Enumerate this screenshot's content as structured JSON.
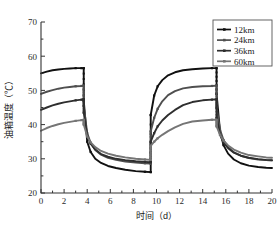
{
  "chart_data": {
    "type": "line",
    "title": "",
    "xlabel": "时间（d）",
    "ylabel": "油箱温度（℃）",
    "xlim": [
      0,
      20
    ],
    "ylim": [
      20,
      70
    ],
    "xticks": [
      0,
      2,
      4,
      6,
      8,
      10,
      12,
      14,
      16,
      18,
      20
    ],
    "yticks": [
      20,
      30,
      40,
      50,
      60,
      70
    ],
    "xtick_labels": [
      "0",
      "2",
      "4",
      "6",
      "8",
      "10",
      "12",
      "14",
      "16",
      "18",
      "20"
    ],
    "ytick_labels": [
      "20",
      "30",
      "40",
      "50",
      "60",
      "70"
    ],
    "grid": false,
    "legend_position": "top-right",
    "minor_ticks": true,
    "markers": "filled-square",
    "segment_breaks": [
      3.7,
      9.5,
      15.2
    ],
    "series": [
      {
        "name": "12km",
        "color": "#111111",
        "x": [
          0,
          0.5,
          1,
          1.5,
          2,
          2.5,
          3,
          3.5,
          3.7,
          3.7,
          4,
          4.3,
          4.7,
          5.2,
          5.8,
          6.5,
          7.3,
          8.2,
          9,
          9.5,
          9.5,
          9.8,
          10.1,
          10.5,
          11,
          11.6,
          12.3,
          13.1,
          14,
          14.8,
          15.2,
          15.2,
          15.5,
          15.8,
          16.2,
          16.7,
          17.3,
          18,
          18.8,
          19.5,
          20
        ],
        "y": [
          55.0,
          55.5,
          55.9,
          56.1,
          56.3,
          56.4,
          56.5,
          56.5,
          56.5,
          47.0,
          35.0,
          32.0,
          30.0,
          28.8,
          27.9,
          27.3,
          26.8,
          26.4,
          26.2,
          26.1,
          42.8,
          48.5,
          51.2,
          53.0,
          54.4,
          55.3,
          55.9,
          56.2,
          56.4,
          56.5,
          56.5,
          49.0,
          38.0,
          34.0,
          31.5,
          29.8,
          28.7,
          28.0,
          27.6,
          27.4,
          27.3
        ]
      },
      {
        "name": "24km",
        "color": "#4f4f4f",
        "x": [
          0,
          0.5,
          1,
          1.5,
          2,
          2.5,
          3,
          3.5,
          3.7,
          3.7,
          4,
          4.3,
          4.7,
          5.2,
          5.8,
          6.5,
          7.3,
          8.2,
          9,
          9.5,
          9.5,
          9.8,
          10.1,
          10.5,
          11,
          11.6,
          12.3,
          13.1,
          14,
          14.8,
          15.2,
          15.2,
          15.5,
          15.8,
          16.2,
          16.7,
          17.3,
          18,
          18.8,
          19.5,
          20
        ],
        "y": [
          49.0,
          49.6,
          50.1,
          50.5,
          50.8,
          51.0,
          51.2,
          51.3,
          51.4,
          45.5,
          37.5,
          34.6,
          32.6,
          31.2,
          30.3,
          29.7,
          29.2,
          28.9,
          28.7,
          28.6,
          38.0,
          42.0,
          44.6,
          46.8,
          48.6,
          49.8,
          50.6,
          51.0,
          51.2,
          51.3,
          51.4,
          45.0,
          38.5,
          35.5,
          33.4,
          31.9,
          30.9,
          30.2,
          29.8,
          29.6,
          29.5
        ]
      },
      {
        "name": "36km",
        "color": "#2e2e2e",
        "x": [
          0,
          0.5,
          1,
          1.5,
          2,
          2.5,
          3,
          3.5,
          3.7,
          3.7,
          4,
          4.3,
          4.7,
          5.2,
          5.8,
          6.5,
          7.3,
          8.2,
          9,
          9.5,
          9.5,
          9.8,
          10.1,
          10.5,
          11,
          11.6,
          12.3,
          13.1,
          14,
          14.8,
          15.2,
          15.2,
          15.5,
          15.8,
          16.2,
          16.7,
          17.3,
          18,
          18.8,
          19.5,
          20
        ],
        "y": [
          44.3,
          45.0,
          45.6,
          46.1,
          46.5,
          46.8,
          47.1,
          47.3,
          47.4,
          43.5,
          36.8,
          34.4,
          32.7,
          31.4,
          30.6,
          30.0,
          29.6,
          29.3,
          29.1,
          29.0,
          35.0,
          37.5,
          39.5,
          41.2,
          42.8,
          44.3,
          45.7,
          46.6,
          47.1,
          47.3,
          47.4,
          42.0,
          37.0,
          34.8,
          33.1,
          31.8,
          30.9,
          30.3,
          29.9,
          29.7,
          29.6
        ]
      },
      {
        "name": "60km",
        "color": "#757575",
        "x": [
          0,
          0.5,
          1,
          1.5,
          2,
          2.5,
          3,
          3.5,
          3.7,
          3.7,
          4,
          4.3,
          4.7,
          5.2,
          5.8,
          6.5,
          7.3,
          8.2,
          9,
          9.5,
          9.5,
          9.8,
          10.1,
          10.5,
          11,
          11.6,
          12.3,
          13.1,
          14,
          14.8,
          15.2,
          15.2,
          15.5,
          15.8,
          16.2,
          16.7,
          17.3,
          18,
          18.8,
          19.5,
          20
        ],
        "y": [
          38.2,
          39.0,
          39.6,
          40.1,
          40.5,
          40.8,
          41.1,
          41.3,
          41.4,
          40.0,
          36.5,
          34.8,
          33.4,
          32.3,
          31.5,
          30.9,
          30.4,
          30.0,
          29.8,
          29.7,
          33.8,
          35.0,
          36.0,
          37.0,
          38.1,
          39.2,
          40.2,
          40.9,
          41.2,
          41.4,
          41.4,
          39.5,
          37.0,
          35.3,
          33.9,
          32.7,
          31.8,
          31.1,
          30.7,
          30.4,
          30.3
        ]
      }
    ]
  },
  "legend": {
    "items": [
      {
        "label": "12km"
      },
      {
        "label": "24km"
      },
      {
        "label": "36km"
      },
      {
        "label": "60km"
      }
    ]
  }
}
